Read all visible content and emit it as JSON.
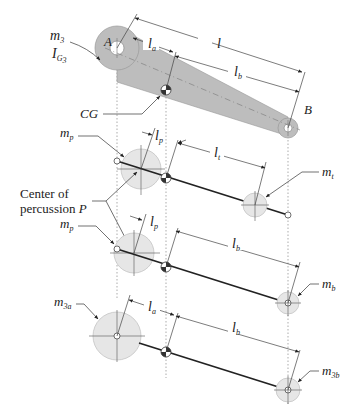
{
  "figure": {
    "type": "mechanism-dynamic-equivalence-diagram",
    "labels": {
      "m3": "m",
      "m3_sub": "3",
      "IG3": "I",
      "IG3_sub": "G",
      "IG3_sub2": "3",
      "A": "A",
      "B": "B",
      "CG": "CG",
      "l": "l",
      "la": "l",
      "la_sub": "a",
      "lb": "l",
      "lb_sub": "b",
      "lp": "l",
      "lp_sub": "p",
      "lt": "l",
      "lt_sub": "t",
      "mp": "m",
      "mp_sub": "p",
      "mt": "m",
      "mt_sub": "t",
      "mb": "m",
      "mb_sub": "b",
      "m3a": "m",
      "m3a_sub": "3a",
      "m3b": "m",
      "m3b_sub": "3b",
      "center_line1": "Center of",
      "center_line2": "percussion ",
      "center_P": "P"
    },
    "colors": {
      "link_fill": "#bdbdbd",
      "mass_fill": "#e6e6e6",
      "mass_stroke": "#c4c4c4",
      "line": "#222222",
      "dim": "#444444"
    }
  }
}
